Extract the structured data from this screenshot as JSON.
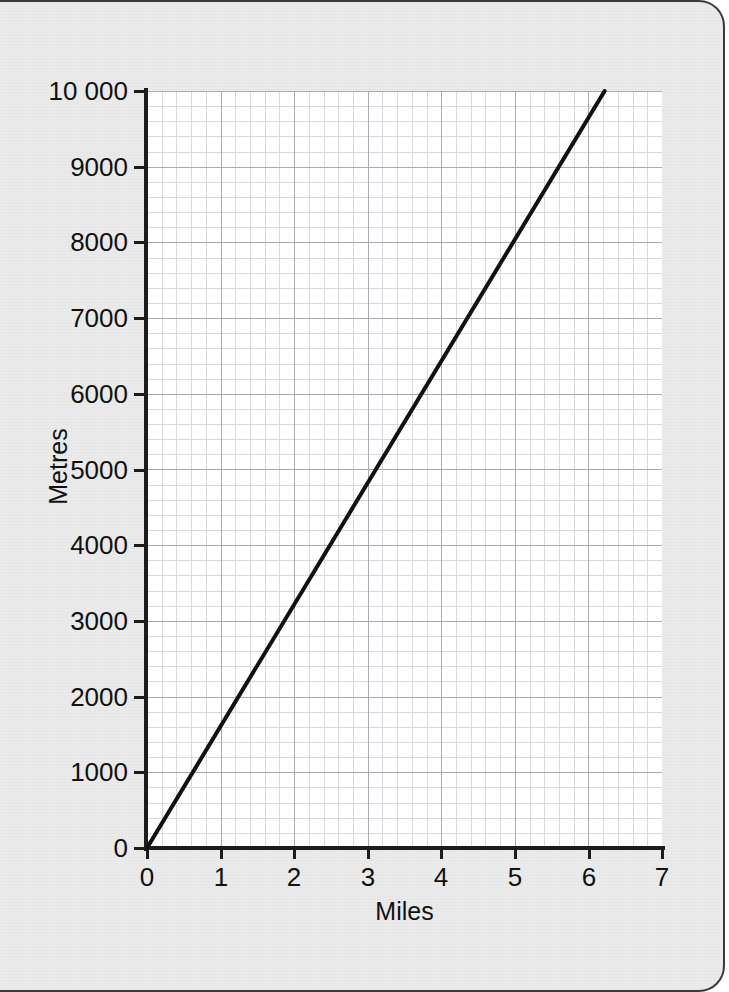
{
  "figure": {
    "background_color": "#ebebeb",
    "plot_background_color": "#ffffff",
    "line_color": "#111111",
    "grid_minor_color": "#d8d8de",
    "grid_major_color": "#aaaab2"
  },
  "chart_data": {
    "type": "line",
    "title": "",
    "subtitle": "",
    "xlabel": "Miles",
    "ylabel": "Metres",
    "xlim": [
      0,
      7
    ],
    "ylim": [
      0,
      10000
    ],
    "xticks": [
      0,
      1,
      2,
      3,
      4,
      5,
      6,
      7
    ],
    "xticklabels": [
      "0",
      "1",
      "2",
      "3",
      "4",
      "5",
      "6",
      "7"
    ],
    "yticks": [
      0,
      1000,
      2000,
      3000,
      4000,
      5000,
      6000,
      7000,
      8000,
      9000,
      10000
    ],
    "yticklabels": [
      "0",
      "1000",
      "2000",
      "3000",
      "4000",
      "5000",
      "6000",
      "7000",
      "8000",
      "9000",
      "10 000"
    ],
    "grid": true,
    "grid_minor_divisions_x": 5,
    "grid_minor_divisions_y": 5,
    "legend": null,
    "annotations": [],
    "series": [
      {
        "name": "Miles to metres conversion",
        "x": [
          0,
          6.22
        ],
        "y": [
          0,
          10000
        ],
        "points": [
          {
            "x": 0,
            "y": 0
          },
          {
            "x": 1,
            "y": 1609
          },
          {
            "x": 2,
            "y": 3218
          },
          {
            "x": 3,
            "y": 4828
          },
          {
            "x": 4,
            "y": 6437
          },
          {
            "x": 5,
            "y": 8046
          },
          {
            "x": 6,
            "y": 9656
          },
          {
            "x": 6.22,
            "y": 10000
          }
        ],
        "color": "#111111",
        "line_width": 4
      }
    ]
  }
}
